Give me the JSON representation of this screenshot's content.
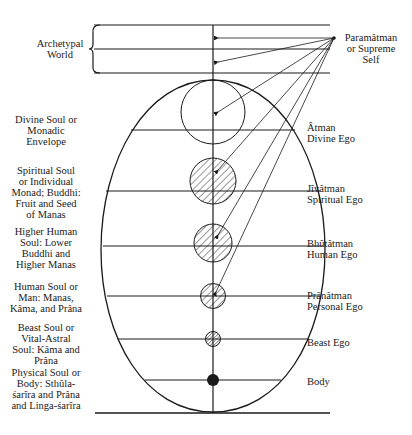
{
  "diagram": {
    "top": {
      "archetypal_world": "Archetypal\nWorld",
      "paramatman": "Paramâtman\nor  Supreme\nSelf"
    },
    "left_labels": [
      {
        "text": "Divine Soul or\nMonadic\nEnvelope"
      },
      {
        "text": "Spiritual Soul\nor Individual\nMonad; Buddhi:\nFruit and Seed\nof Manas"
      },
      {
        "text": "Higher Human\nSoul: Lower\nBuddhi and\nHigher Manas"
      },
      {
        "text": "Human Soul or\nMan: Manas,\nKâma, and Prâna"
      },
      {
        "text": "Beast Soul or\nVital-Astral\nSoul: Kâma and\nPrâna"
      },
      {
        "text": "Physical Soul or\nBody: Sthûla-\nśarîra and Prâna\nand Linga-śarîra"
      }
    ],
    "right_labels": [
      {
        "text": "Âtman\nDivine Ego"
      },
      {
        "text": "Jîvâtman\nSpiritual Ego"
      },
      {
        "text": "Bhûtâtman\nHuman Ego"
      },
      {
        "text": "Prânâtman\nPersonal Ego"
      },
      {
        "text": "Beast Ego"
      },
      {
        "text": "Body"
      }
    ],
    "colors": {
      "line": "#1a1a1a",
      "background": "#ffffff"
    }
  }
}
